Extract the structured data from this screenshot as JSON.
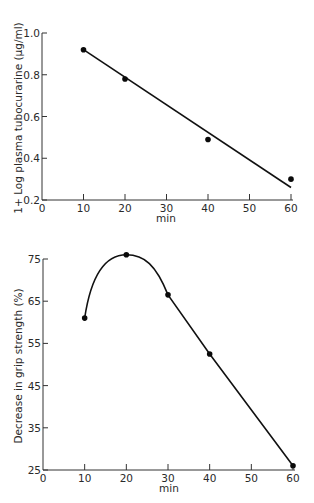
{
  "chart_data": [
    {
      "type": "scatter",
      "title": "",
      "xlabel": "min",
      "ylabel": "1+ Log plasma tubocurarine (µg/ml)",
      "xlim": [
        0,
        60
      ],
      "ylim": [
        0.2,
        1.0
      ],
      "x_ticks": [
        0,
        10,
        20,
        30,
        40,
        50,
        60
      ],
      "y_ticks": [
        0.2,
        0.4,
        0.6,
        0.8,
        1.0
      ],
      "x_tick_labels": [
        "0",
        "10",
        "20",
        "30",
        "40",
        "50",
        "60"
      ],
      "y_tick_labels": [
        "0.2",
        "0.4",
        "0.6",
        "0.8",
        "1.0"
      ],
      "grid": false,
      "series": [
        {
          "name": "observed",
          "x": [
            10,
            20,
            40,
            60
          ],
          "y": [
            0.92,
            0.78,
            0.49,
            0.3
          ]
        }
      ],
      "fit_line": {
        "x": [
          10,
          60
        ],
        "y": [
          0.92,
          0.26
        ]
      }
    },
    {
      "type": "line",
      "title": "",
      "xlabel": "min",
      "ylabel": "Decrease in grip strength (%)",
      "xlim": [
        0,
        60
      ],
      "ylim": [
        25,
        75
      ],
      "x_ticks": [
        0,
        10,
        20,
        30,
        40,
        50,
        60
      ],
      "y_ticks": [
        25,
        35,
        45,
        55,
        65,
        75
      ],
      "x_tick_labels": [
        "0",
        "10",
        "20",
        "30",
        "40",
        "50",
        "60"
      ],
      "y_tick_labels": [
        "25",
        "35",
        "45",
        "55",
        "65",
        "75"
      ],
      "grid": false,
      "series": [
        {
          "name": "grip strength decrease",
          "x": [
            10,
            20,
            30,
            40,
            60
          ],
          "y": [
            61,
            76,
            66.5,
            52.5,
            26
          ]
        }
      ]
    }
  ],
  "labels": {
    "top_ylabel": "1+ Log plasma tubocurarine (µg/ml)",
    "top_xlabel": "min",
    "bottom_ylabel": "Decrease in grip strength (%)",
    "bottom_xlabel": "min"
  }
}
